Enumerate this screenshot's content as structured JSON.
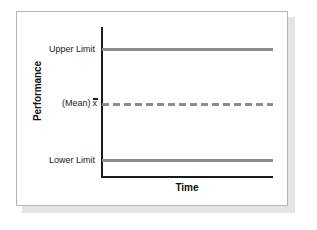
{
  "figure": {
    "background_color": "#ffffff",
    "card_border_color": "#b5b5b5",
    "shadow_color": "#e4e4e4"
  },
  "chart_data": {
    "type": "line",
    "title": "",
    "subtitle": "",
    "xlabel": "Time",
    "ylabel": "Performance",
    "grid": false,
    "legend_position": "none",
    "axis_color": "#1a1a1a",
    "series": [
      {
        "name": "Upper Limit",
        "label": "Upper Limit",
        "value": 1,
        "style": "solid",
        "color": "#8c8c8c",
        "values": [
          1,
          1
        ]
      },
      {
        "name": "Mean",
        "label": "(Mean)",
        "symbol": "x",
        "value": 0,
        "style": "dashed",
        "color": "#8c8c8c",
        "values": [
          0,
          0
        ]
      },
      {
        "name": "Lower Limit",
        "label": "Lower Limit",
        "value": -1,
        "style": "solid",
        "color": "#8c8c8c",
        "values": [
          -1,
          -1
        ]
      }
    ],
    "x": [
      0,
      1
    ],
    "xlim": [
      0,
      1
    ],
    "ylim": [
      -1.25,
      1.25
    ],
    "ytick_labels": [
      "Upper Limit",
      "(Mean) x",
      "Lower Limit"
    ],
    "ytick_values": [
      1,
      0,
      -1
    ],
    "xtick_labels": []
  }
}
